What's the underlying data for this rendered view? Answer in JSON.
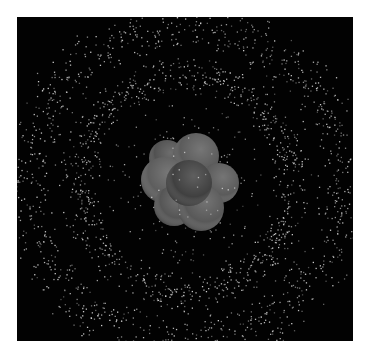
{
  "image": {
    "subject": "3D render of an atom",
    "background_color": "#ffffff",
    "frame": {
      "x": 17,
      "y": 17,
      "width": 336,
      "height": 324,
      "color": "#020202"
    }
  },
  "electron_cloud": {
    "dot_color": "#d8d8d8",
    "center": [
      168,
      166
    ],
    "shells": [
      {
        "name": "inner-shell",
        "rx": 108,
        "ry": 108,
        "thickness": 22,
        "count": 900,
        "tilt": -0.15
      },
      {
        "name": "outer-shell",
        "rx": 160,
        "ry": 158,
        "thickness": 30,
        "count": 1100,
        "tilt": 0.1
      }
    ],
    "interior_scatter": {
      "count": 160,
      "radius": 80
    }
  },
  "nucleus": {
    "center": [
      172,
      166
    ],
    "spheres": [
      {
        "name": "proton-back-left",
        "cx": -22,
        "cy": -25,
        "r": 18,
        "color": "#4e4e4e"
      },
      {
        "name": "proton-top",
        "cx": 7,
        "cy": -27,
        "r": 23,
        "color": "#585858"
      },
      {
        "name": "proton-left",
        "cx": -25,
        "cy": -3,
        "r": 23,
        "color": "#5a5a5a"
      },
      {
        "name": "proton-right",
        "cx": 30,
        "cy": 0,
        "r": 20,
        "color": "#575757"
      },
      {
        "name": "proton-bottom-left",
        "cx": -15,
        "cy": 23,
        "r": 20,
        "color": "#525252"
      },
      {
        "name": "proton-bottom-right",
        "cx": 12,
        "cy": 25,
        "r": 23,
        "color": "#555555"
      },
      {
        "name": "proton-center",
        "cx": 0,
        "cy": 0,
        "r": 23,
        "color": "#3c3c3c"
      }
    ]
  }
}
